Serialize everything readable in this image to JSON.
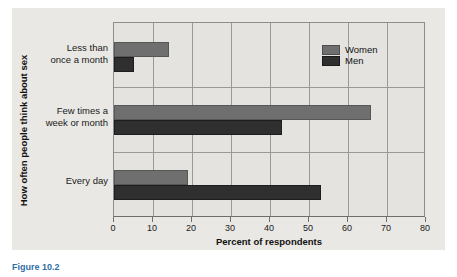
{
  "chart_data": {
    "type": "bar",
    "orientation": "horizontal",
    "title": "",
    "xlabel": "Percent of respondents",
    "ylabel": "How often people think about sex",
    "xlim": [
      0,
      80
    ],
    "xticks": [
      0,
      10,
      20,
      30,
      40,
      50,
      60,
      70,
      80
    ],
    "grid": true,
    "legend_position": "top-right",
    "categories": [
      "Less than\nonce a month",
      "Few times a\nweek or month",
      "Every day"
    ],
    "series": [
      {
        "name": "Women",
        "color": "#6f6f6f",
        "values": [
          14,
          66,
          19
        ]
      },
      {
        "name": "Men",
        "color": "#2f2f2f",
        "values": [
          5,
          43,
          53
        ]
      }
    ]
  },
  "legend": {
    "items": [
      {
        "label": "Women"
      },
      {
        "label": "Men"
      }
    ]
  },
  "axes": {
    "x_title": "Percent of respondents",
    "y_title": "How often people think about sex",
    "x_tick_labels": [
      "0",
      "10",
      "20",
      "30",
      "40",
      "50",
      "60",
      "70",
      "80"
    ]
  },
  "caption": {
    "text": "Figure 10.2"
  }
}
